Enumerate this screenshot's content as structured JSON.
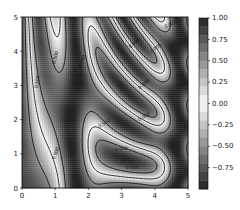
{
  "chart_data": {
    "type": "heatmap",
    "subtype": "filled-contour-with-contour-lines",
    "title": "",
    "xlabel": "",
    "ylabel": "",
    "xlim": [
      0,
      5
    ],
    "ylim": [
      0,
      5
    ],
    "x_ticks": [
      "0",
      "1",
      "2",
      "3",
      "4",
      "5"
    ],
    "y_ticks": [
      "0",
      "1",
      "2",
      "3",
      "4",
      "5"
    ],
    "function": "z = sin(x)^10 + cos(10 + y*x) * cos(x)",
    "colormap": "gray",
    "contour_levels": [
      -0.5,
      0.0,
      0.5
    ],
    "contour_labels": [
      "-0.500",
      "0.000",
      "0.500"
    ],
    "colorbar": {
      "range": [
        -1.0,
        1.0
      ],
      "ticks": [
        "1.00",
        "0.75",
        "0.50",
        "0.25",
        "0.00",
        "−0.25",
        "−0.50",
        "−0.75"
      ],
      "tick_values": [
        1.0,
        0.75,
        0.5,
        0.25,
        0.0,
        -0.25,
        -0.5,
        -0.75
      ]
    },
    "grid": false,
    "legend": "none"
  },
  "layout": {
    "plot": {
      "left": 22,
      "top": 17,
      "right": 188,
      "bottom": 188
    },
    "colorbar": {
      "left": 199,
      "top": 18,
      "right": 208,
      "bottom": 189
    }
  }
}
